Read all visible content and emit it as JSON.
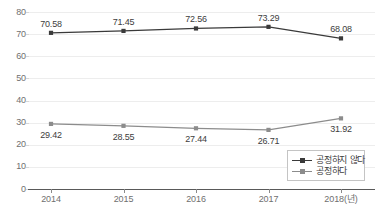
{
  "chart_data": {
    "type": "line",
    "title": "",
    "xlabel": "",
    "ylabel": "",
    "categories": [
      "2014",
      "2015",
      "2016",
      "2017",
      "2018(년)"
    ],
    "ytick_labels": [
      "80",
      "70",
      "60",
      "50",
      "40",
      "30",
      "20",
      "10",
      "0"
    ],
    "ylim": [
      0,
      80
    ],
    "ytick_step": 10,
    "grid": true,
    "legend_position": "inside-bottom-right",
    "series": [
      {
        "name": "공정하지 않다",
        "color": "#3a3a3a",
        "label_position": "above",
        "values": [
          70.58,
          71.45,
          72.56,
          73.29,
          68.08
        ],
        "value_labels": [
          "70.58",
          "71.45",
          "72.56",
          "73.29",
          "68.08"
        ]
      },
      {
        "name": "공정하다",
        "color": "#8c8c8c",
        "label_position": "below",
        "values": [
          29.42,
          28.55,
          27.44,
          26.71,
          31.92
        ],
        "value_labels": [
          "29.42",
          "28.55",
          "27.44",
          "26.71",
          "31.92"
        ]
      }
    ]
  },
  "colors": {
    "series_dark": "#3a3a3a",
    "series_gray": "#8c8c8c",
    "gridline": "#ededed",
    "axis": "#595959",
    "tick_text": "#6f6f6f",
    "label_text": "#3d3d3d",
    "legend_border": "#c4c4c4",
    "background": "#ffffff"
  }
}
